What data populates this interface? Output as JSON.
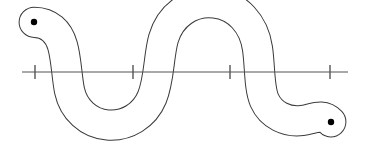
{
  "figure": {
    "background_color": "#ffffff",
    "width": 367,
    "height": 146
  },
  "style": {
    "curve_color": "#3a3a3a",
    "curve_width": 1,
    "axis_color": "#555555",
    "axis_width": 1.2,
    "tick_color": "#555555",
    "tick_width": 1.4,
    "dot_color": "#000000",
    "dot_radius": 3.2
  },
  "axis": {
    "label": "number-line",
    "y": 72,
    "x_start": 22,
    "x_end": 348,
    "tick_half_height": 7,
    "ticks": [
      {
        "name": "tick-1",
        "x": 35
      },
      {
        "name": "tick-2",
        "x": 133
      },
      {
        "name": "tick-3",
        "x": 230
      },
      {
        "name": "tick-4",
        "x": 330
      }
    ]
  },
  "curve": {
    "name": "snake-band",
    "outer_path": "M 33.5 9.2 C 21.5 9.6 15.8 16.0 16.0 22.4 C 16.2 29.4 22.6 35.6 33.6 35.6 C 45.0 35.6 53.0 41.0 58.2 50.0 C 63.4 59.0 66.5 69.5 68.0 80.0 C 70.2 95.5 77.0 109.5 88.0 120.0 C 99.0 130.5 113.5 136.0 128.5 136.0 C 146.0 136.0 161.5 129.0 172.5 117.0 C 183.5 105.0 190.0 88.5 192.5 71.0 C 195.0 53.5 200.5 38.0 211.0 26.5 C 221.5 15.0 236.5 9.0 252.0 9.0 C 268.0 9.0 282.5 15.5 292.5 27.5 C 302.5 39.5 307.5 56.5 308.5 74.5 C 309.3 89.0 313.5 100.0 320.5 106.5 C 327.5 113.0 336.0 114.0 341.5 112.5",
    "inner_path": "M 33.6 25.8 C 29.0 25.8 26.6 24.0 26.5 22.2 C 26.4 20.2 29.0 18.6 33.6 18.6 C 40.0 18.6 45.0 19.6 49.5 21.6 C 62.0 27.2 72.0 38.5 78.0 52.0 C 83.5 64.5 85.5 77.5 87.5 89.5 C 89.5 101.5 96.0 110.5 106.0 114.5 C 116.0 118.5 128.5 117.5 137.5 111.5 C 147.0 105.2 152.0 94.5 153.5 82.5 C 155.0 70.5 155.0 57.5 157.5 45.0 C 161.5 25.0 174.0 11.5 189.0 5.5 C 204.0 -0.5 221.0 0.5 234.0 8.5 C 247.0 16.5 254.5 30.5 257.0 46.5 C 259.0 59.5 258.5 73.5 260.5 85.5 C 262.5 97.5 268.0 106.0 276.5 110.5 C 285.5 115.2 296.5 114.5 304.5 109.5 C 312.0 104.8 316.0 96.0 317.0 86.0",
    "cap_left": "M 33.5 9.2 C 21.5 9.6 15.8 16.0 16.0 22.4 C 16.2 29.4 22.6 35.6 33.6 35.6",
    "cap_right": "M 341.5 112.5 C 347.5 110.5 350.5 106.0 350.0 100.5 C 349.4 94.0 343.0 88.8 333.0 88.8 C 324.5 88.8 319.0 87.5 317.0 86.0",
    "endpoints": [
      {
        "name": "endpoint-dot-left",
        "x": 34,
        "y": 22
      },
      {
        "name": "endpoint-dot-right",
        "x": 331,
        "y": 122
      }
    ]
  }
}
